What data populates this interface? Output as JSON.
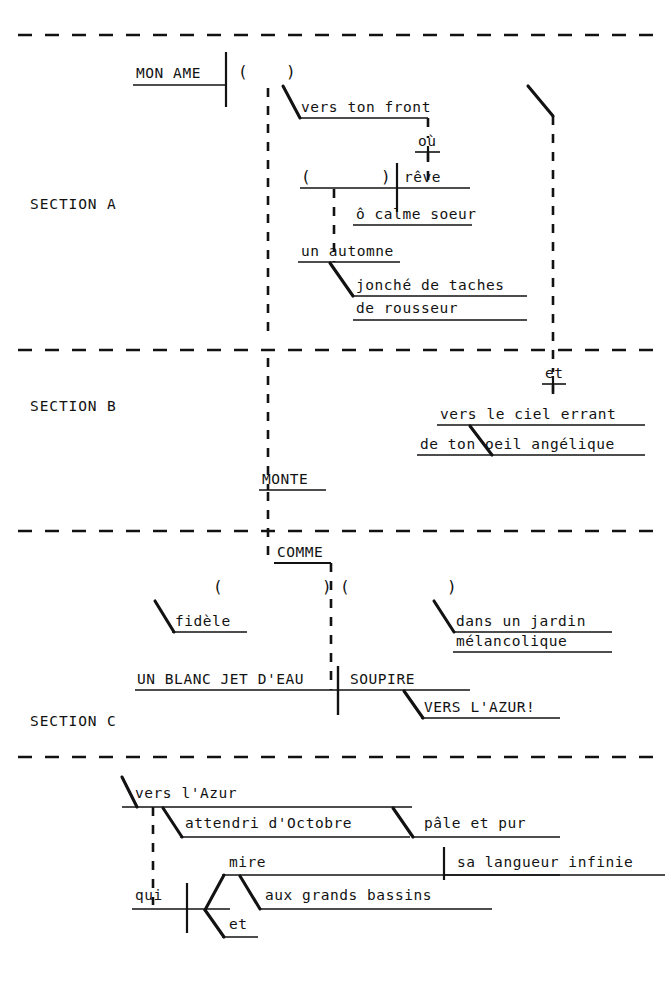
{
  "document": {
    "kind": "sentence-diagram",
    "language": "French",
    "title": "",
    "background_color": "#ffffff",
    "ink_color": "#121212",
    "width": 671,
    "height": 985
  },
  "section_labels": [
    {
      "id": "section-a",
      "text": "SECTION A",
      "x": 30,
      "y": 196
    },
    {
      "id": "section-b",
      "text": "SECTION B",
      "x": 30,
      "y": 398
    },
    {
      "id": "section-c",
      "text": "SECTION C",
      "x": 30,
      "y": 713
    }
  ],
  "words": [
    {
      "id": "w-mon-ame",
      "text": "MON AME",
      "x": 136,
      "y": 66,
      "rule": {
        "x1": 133,
        "x2": 226,
        "y": 85
      }
    },
    {
      "id": "w-vers-ton-front",
      "text": "vers ton front",
      "x": 301,
      "y": 100,
      "rule": {
        "x1": 299,
        "x2": 428,
        "y": 118
      }
    },
    {
      "id": "w-ou",
      "text": "où",
      "x": 418,
      "y": 134,
      "rule": {
        "x1": 415,
        "x2": 440,
        "y": 152
      }
    },
    {
      "id": "w-reve",
      "text": "rêve",
      "x": 404,
      "y": 170,
      "rule": {
        "x1": 300,
        "x2": 470,
        "y": 188
      }
    },
    {
      "id": "w-o-calme-soeur",
      "text": "ô calme soeur",
      "x": 356,
      "y": 207,
      "rule": {
        "x1": 353,
        "x2": 472,
        "y": 225
      }
    },
    {
      "id": "w-un-automne",
      "text": "un automne",
      "x": 301,
      "y": 244,
      "rule": {
        "x1": 298,
        "x2": 400,
        "y": 262
      }
    },
    {
      "id": "w-jonche-de-taches",
      "text": "jonché de taches",
      "x": 356,
      "y": 278,
      "rule": {
        "x1": 353,
        "x2": 527,
        "y": 296
      }
    },
    {
      "id": "w-de-rousseur",
      "text": "de rousseur",
      "x": 356,
      "y": 301,
      "rule": {
        "x1": 353,
        "x2": 527,
        "y": 320
      }
    },
    {
      "id": "w-et",
      "text": "et",
      "x": 545,
      "y": 366,
      "rule": {
        "x1": 542,
        "x2": 566,
        "y": 384
      }
    },
    {
      "id": "w-vers-le-ciel",
      "text": "vers le ciel errant",
      "x": 440,
      "y": 407,
      "rule": {
        "x1": 437,
        "x2": 645,
        "y": 425
      }
    },
    {
      "id": "w-de-ton-oeil",
      "text": "de ton oeil angélique",
      "x": 420,
      "y": 437,
      "rule": {
        "x1": 417,
        "x2": 645,
        "y": 455
      }
    },
    {
      "id": "w-monte",
      "text": "MONTE",
      "x": 262,
      "y": 472,
      "rule": {
        "x1": 259,
        "x2": 326,
        "y": 490
      }
    },
    {
      "id": "w-comme",
      "text": "COMME",
      "x": 277,
      "y": 545,
      "rule": {
        "x1": 274,
        "x2": 331,
        "y": 563
      }
    },
    {
      "id": "w-fidele",
      "text": "fidèle",
      "x": 175,
      "y": 614,
      "rule": {
        "x1": 172,
        "x2": 247,
        "y": 632
      }
    },
    {
      "id": "w-dans-un-jardin",
      "text": "dans un jardin",
      "x": 456,
      "y": 614,
      "rule": {
        "x1": 453,
        "x2": 612,
        "y": 632
      }
    },
    {
      "id": "w-melancolique",
      "text": "mélancolique",
      "x": 456,
      "y": 634,
      "rule": {
        "x1": 453,
        "x2": 612,
        "y": 652
      }
    },
    {
      "id": "w-un-blanc-jet",
      "text": "UN BLANC JET D'EAU",
      "x": 137,
      "y": 672,
      "rule": {
        "x1": 135,
        "x2": 338,
        "y": 690
      }
    },
    {
      "id": "w-soupire",
      "text": "SOUPIRE",
      "x": 350,
      "y": 672,
      "rule": {
        "x1": 338,
        "x2": 470,
        "y": 690
      }
    },
    {
      "id": "w-vers-lazur-excl",
      "text": "VERS L'AZUR!",
      "x": 424,
      "y": 700,
      "rule": {
        "x1": 421,
        "x2": 560,
        "y": 718
      }
    },
    {
      "id": "w-vers-lazur",
      "text": "vers l'Azur",
      "x": 135,
      "y": 786,
      "rule": {
        "x1": 122,
        "x2": 412,
        "y": 807
      }
    },
    {
      "id": "w-attendri",
      "text": "attendri d'Octobre",
      "x": 185,
      "y": 816,
      "rule": {
        "x1": 180,
        "x2": 410,
        "y": 837
      }
    },
    {
      "id": "w-pale-et-pur",
      "text": "pâle et pur",
      "x": 424,
      "y": 816,
      "rule": {
        "x1": 412,
        "x2": 560,
        "y": 837
      }
    },
    {
      "id": "w-mire",
      "text": "mire",
      "x": 229,
      "y": 855,
      "rule": {
        "x1": 222,
        "x2": 560,
        "y": 875
      }
    },
    {
      "id": "w-sa-langueur",
      "text": "sa langueur infinie",
      "x": 457,
      "y": 855,
      "rule": {
        "x1": 444,
        "x2": 665,
        "y": 875
      }
    },
    {
      "id": "w-qui",
      "text": "qui",
      "x": 135,
      "y": 888,
      "rule": {
        "x1": 132,
        "x2": 230,
        "y": 909
      }
    },
    {
      "id": "w-aux-grands-bassins",
      "text": "aux grands bassins",
      "x": 265,
      "y": 888,
      "rule": {
        "x1": 260,
        "x2": 492,
        "y": 909
      }
    },
    {
      "id": "w-et-bottom",
      "text": "et",
      "x": 229,
      "y": 917,
      "rule": {
        "x1": 222,
        "x2": 258,
        "y": 937
      }
    }
  ],
  "parentheses": [
    {
      "id": "paren-a-open",
      "glyph": "(",
      "x": 238,
      "y": 62
    },
    {
      "id": "paren-a-close",
      "glyph": ")",
      "x": 286,
      "y": 62
    },
    {
      "id": "paren-reve-open",
      "glyph": "(",
      "x": 301,
      "y": 167
    },
    {
      "id": "paren-reve-close",
      "glyph": ")",
      "x": 381,
      "y": 167
    },
    {
      "id": "paren-comme-close",
      "glyph": ")",
      "x": 322,
      "y": 577
    },
    {
      "id": "paren-comme-open",
      "glyph": "(",
      "x": 340,
      "y": 577
    },
    {
      "id": "paren-jardin-close",
      "glyph": ")",
      "x": 447,
      "y": 577
    },
    {
      "id": "paren-fidele-open",
      "glyph": "(",
      "x": 213,
      "y": 577
    }
  ],
  "dividers": [
    {
      "id": "divider-top",
      "y": 35,
      "x1": 18,
      "x2": 655
    },
    {
      "id": "divider-a-b",
      "y": 350,
      "x1": 18,
      "x2": 655
    },
    {
      "id": "divider-b-c",
      "y": 531,
      "x1": 18,
      "x2": 655
    },
    {
      "id": "divider-c-d",
      "y": 757,
      "x1": 18,
      "x2": 655
    }
  ],
  "connectors": {
    "dashed_vertical_runs": [
      {
        "id": "dash-trunk-left",
        "x": 268,
        "y1": 88,
        "y2": 340
      },
      {
        "id": "dash-trunk-left2",
        "x": 268,
        "y1": 358,
        "y2": 490
      },
      {
        "id": "dash-trunk-left3",
        "x": 268,
        "y1": 492,
        "y2": 563
      },
      {
        "id": "dash-comme-down",
        "x": 331,
        "y1": 563,
        "y2": 690
      },
      {
        "id": "dash-front-ou",
        "x": 428,
        "y1": 118,
        "y2": 138
      },
      {
        "id": "dash-ou-reve",
        "x": 428,
        "y1": 153,
        "y2": 188
      },
      {
        "id": "dash-reve-calme",
        "x": 334,
        "y1": 189,
        "y2": 262
      },
      {
        "id": "dash-trunk-right",
        "x": 553,
        "y1": 116,
        "y2": 372
      },
      {
        "id": "dash-et-down",
        "x": 553,
        "y1": 385,
        "y2": 400
      },
      {
        "id": "dash-qui-up",
        "x": 153,
        "y1": 807,
        "y2": 905
      }
    ],
    "solid_verticals": [
      {
        "id": "bar-mon-ame",
        "x": 226,
        "y1": 52,
        "y2": 107
      },
      {
        "id": "bar-ou-stub",
        "x": 428,
        "y1": 146,
        "y2": 160
      },
      {
        "id": "bar-reve",
        "x": 397,
        "y1": 163,
        "y2": 212
      },
      {
        "id": "bar-et-stub",
        "x": 553,
        "y1": 376,
        "y2": 392
      },
      {
        "id": "bar-soupire",
        "x": 338,
        "y1": 666,
        "y2": 715
      },
      {
        "id": "bar-blanc-jet",
        "x": 338,
        "y1": 666,
        "y2": 715
      },
      {
        "id": "bar-langueur",
        "x": 444,
        "y1": 847,
        "y2": 880
      },
      {
        "id": "bar-qui",
        "x": 187,
        "y1": 883,
        "y2": 933
      }
    ],
    "diagonals": [
      {
        "id": "diag-mon-ame-to-front",
        "x1": 283,
        "y1": 86,
        "x2": 300,
        "y2": 118
      },
      {
        "id": "diag-trunk-right-bend",
        "x1": 528,
        "y1": 86,
        "x2": 553,
        "y2": 116
      },
      {
        "id": "diag-automne-jonche",
        "x1": 330,
        "y1": 263,
        "x2": 353,
        "y2": 296
      },
      {
        "id": "diag-ciel-oeil",
        "x1": 470,
        "y1": 426,
        "x2": 492,
        "y2": 455
      },
      {
        "id": "diag-fidele",
        "x1": 155,
        "y1": 601,
        "x2": 174,
        "y2": 632
      },
      {
        "id": "diag-jardin",
        "x1": 434,
        "y1": 601,
        "x2": 454,
        "y2": 632
      },
      {
        "id": "diag-soupire-azur",
        "x1": 404,
        "y1": 691,
        "x2": 423,
        "y2": 718
      },
      {
        "id": "diag-azur-left",
        "x1": 122,
        "y1": 777,
        "x2": 137,
        "y2": 807
      },
      {
        "id": "diag-attendri",
        "x1": 163,
        "y1": 808,
        "x2": 182,
        "y2": 837
      },
      {
        "id": "diag-pale",
        "x1": 393,
        "y1": 808,
        "x2": 413,
        "y2": 837
      },
      {
        "id": "diag-qui-mire",
        "x1": 205,
        "y1": 910,
        "x2": 224,
        "y2": 875
      },
      {
        "id": "diag-qui-et",
        "x1": 205,
        "y1": 910,
        "x2": 224,
        "y2": 937
      },
      {
        "id": "diag-mire-bassins",
        "x1": 240,
        "y1": 876,
        "x2": 260,
        "y2": 909
      }
    ],
    "comme_bracket": {
      "id": "comme-bracket",
      "x1": 274,
      "y": 563,
      "x2": 331
    }
  },
  "transcription": {
    "section_a": "MON AME ( ) vers ton front où rêve ô calme soeur un automne jonché de taches de rousseur",
    "section_b": "et vers le ciel errant de ton oeil angélique MONTE",
    "section_c": "COMME ( ) fidèle ( ) dans un jardin mélancolique UN BLANC JET D'EAU SOUPIRE VERS L'AZUR!",
    "section_d": "vers l'Azur attendri d'Octobre pâle et pur qui mire sa langueur infinie aux grands bassins et"
  }
}
